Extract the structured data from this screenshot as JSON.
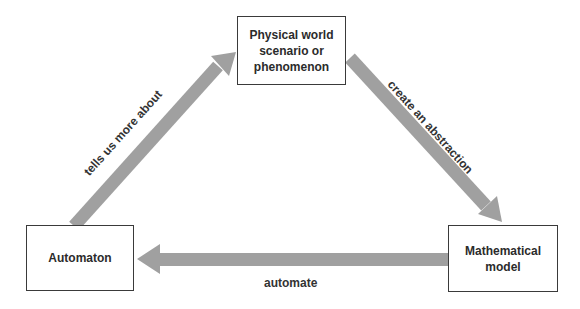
{
  "diagram": {
    "nodes": [
      {
        "id": "physical",
        "label": "Physical world\nscenario or\nphenomenon"
      },
      {
        "id": "automaton",
        "label": "Automaton"
      },
      {
        "id": "math",
        "label": "Mathematical\nmodel"
      }
    ],
    "edges": [
      {
        "from": "automaton",
        "to": "physical",
        "label": "tells us more about"
      },
      {
        "from": "physical",
        "to": "math",
        "label": "create an abstraction"
      },
      {
        "from": "math",
        "to": "automaton",
        "label": "automate"
      }
    ],
    "colors": {
      "arrow": "#a0a0a0",
      "box_border": "#3a3a3a",
      "text": "#2b2b2b"
    }
  }
}
